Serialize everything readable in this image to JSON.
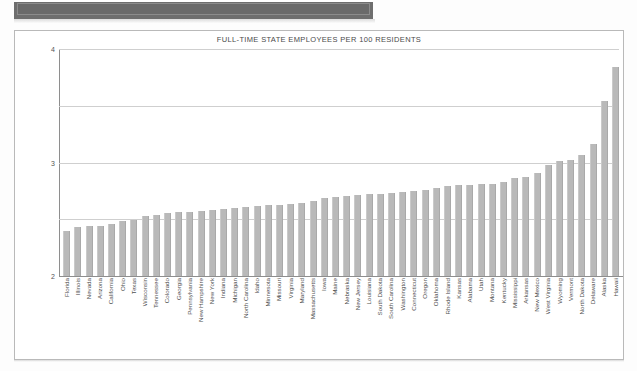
{
  "document": {
    "header_band_label": "",
    "frame_name": "chart-border"
  },
  "chart_data": {
    "type": "bar",
    "title": "FULL-TIME STATE EMPLOYEES PER 100 RESIDENTS",
    "xlabel": "",
    "ylabel": "",
    "ylim": [
      0,
      4
    ],
    "yticks": [
      1,
      2,
      3,
      4
    ],
    "ytick_labels": [
      "1",
      "2",
      "3",
      "4"
    ],
    "grid": true,
    "legend": "none",
    "bar_color": "#b9b9b9",
    "categories": [
      "Florida",
      "Illinois",
      "Nevada",
      "Arizona",
      "California",
      "Ohio",
      "Texas",
      "Wisconsin",
      "Tennessee",
      "Colorado",
      "Georgia",
      "Pennsylvania",
      "New Hampshire",
      "New York",
      "Indiana",
      "Michigan",
      "North Carolina",
      "Idaho",
      "Minnesota",
      "Missouri",
      "Virginia",
      "Maryland",
      "Massachusetts",
      "Iowa",
      "Maine",
      "Nebraska",
      "New Jersey",
      "Louisiana",
      "South Dakota",
      "South Carolina",
      "Washington",
      "Connecticut",
      "Oregon",
      "Oklahoma",
      "Rhode Island",
      "Kansas",
      "Alabama",
      "Utah",
      "Montana",
      "Kentucky",
      "Mississippi",
      "Arkansas",
      "New Mexico",
      "West Virginia",
      "Wyoming",
      "Vermont",
      "North Dakota",
      "Delaware",
      "Alaska",
      "Hawaii"
    ],
    "values": [
      0.8,
      0.86,
      0.88,
      0.89,
      0.92,
      0.97,
      0.98,
      1.05,
      1.08,
      1.11,
      1.12,
      1.13,
      1.14,
      1.16,
      1.18,
      1.2,
      1.21,
      1.23,
      1.25,
      1.26,
      1.27,
      1.28,
      1.32,
      1.38,
      1.4,
      1.41,
      1.43,
      1.44,
      1.45,
      1.46,
      1.48,
      1.5,
      1.52,
      1.55,
      1.58,
      1.6,
      1.61,
      1.62,
      1.63,
      1.65,
      1.72,
      1.74,
      1.82,
      1.96,
      2.02,
      2.05,
      2.13,
      2.33,
      3.08,
      3.68
    ]
  }
}
